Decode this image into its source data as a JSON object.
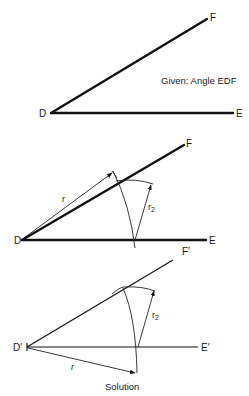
{
  "figures": [
    {
      "id": "given",
      "labels": {
        "vertex": "D",
        "ray1_end": "E",
        "ray2_end": "F"
      },
      "caption": "Given: Angle EDF"
    },
    {
      "id": "construction",
      "labels": {
        "vertex": "D",
        "ray1_end": "E",
        "ray2_end": "F",
        "radius": "r",
        "chord_radius": "r",
        "chord_sub": "2"
      }
    },
    {
      "id": "solution",
      "labels": {
        "vertex": "D′",
        "ray1_end": "E′",
        "ray2_end": "F′",
        "radius": "r",
        "chord_radius": "r",
        "chord_sub": "2"
      },
      "caption": "Solution"
    }
  ],
  "colors": {
    "ink": "#111111",
    "background": "#ffffff"
  }
}
